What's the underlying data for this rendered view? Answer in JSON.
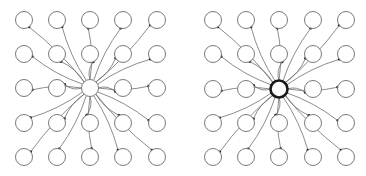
{
  "diagram": {
    "type": "star-graph-comparison",
    "panels": [
      {
        "name": "left-panel",
        "grid": {
          "cols": 5,
          "rows": 5
        },
        "columns_x": [
          24,
          57,
          90,
          123,
          157
        ],
        "rows_y": [
          20,
          54,
          88,
          123,
          157
        ],
        "node_radius": 8.5,
        "hub": {
          "col": 2,
          "row": 2,
          "style": "thin"
        }
      },
      {
        "name": "right-panel",
        "grid": {
          "cols": 5,
          "rows": 5
        },
        "columns_x": [
          213,
          246,
          279,
          313,
          346
        ],
        "rows_y": [
          20,
          54,
          89,
          123,
          157
        ],
        "node_radius": 8.5,
        "hub": {
          "col": 2,
          "row": 2,
          "style": "thick"
        }
      }
    ],
    "colors": {
      "node_stroke": "#7a7a7a",
      "edge": "#6e6e6e",
      "arrowhead": "#222222",
      "hub_thick_stroke": "#1a1a1a",
      "background": "#ffffff"
    }
  }
}
